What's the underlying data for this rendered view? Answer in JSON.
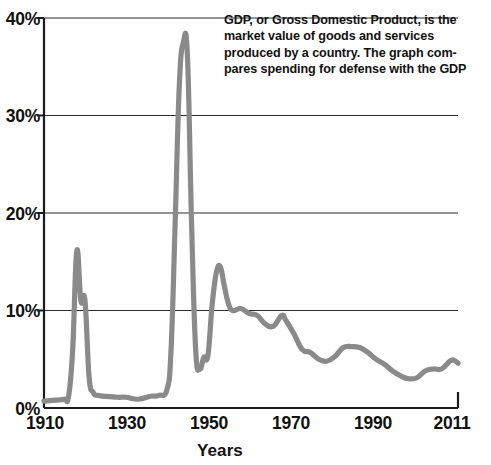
{
  "annotation": {
    "lines": [
      "GDP, or Gross Domestic Product, is the",
      "market value of goods and services",
      "produced by a country. The graph com-",
      "pares spending for defense with the GDP"
    ]
  },
  "axis": {
    "x_title": "Years",
    "y_ticks": [
      "0%",
      "10%",
      "20%",
      "30%",
      "40%"
    ],
    "x_ticks": [
      "1910",
      "1930",
      "1950",
      "1970",
      "1990",
      "2011"
    ]
  },
  "colors": {
    "line": "#8a8a8a",
    "axis": "#1a1a1a",
    "grid": "#2b2b2b",
    "text": "#111111",
    "background": "#ffffff"
  },
  "chart_data": {
    "type": "line",
    "title": "",
    "xlabel": "Years",
    "ylabel": "",
    "xlim": [
      1910,
      2011
    ],
    "ylim": [
      0,
      40
    ],
    "grid": true,
    "legend": false,
    "y_tick_values": [
      0,
      10,
      20,
      30,
      40
    ],
    "y_tick_labels": [
      "0%",
      "10%",
      "20%",
      "30%",
      "40%"
    ],
    "x_tick_values": [
      1910,
      1930,
      1950,
      1970,
      1990,
      2011
    ],
    "x_tick_labels": [
      "1910",
      "1930",
      "1950",
      "1970",
      "1990",
      "2011"
    ],
    "series": [
      {
        "name": "Defense spending as percent of GDP",
        "x": [
          1910,
          1913,
          1915,
          1916,
          1917,
          1918,
          1919,
          1920,
          1921,
          1922,
          1923,
          1925,
          1928,
          1930,
          1933,
          1936,
          1938,
          1940,
          1941,
          1942,
          1943,
          1944,
          1945,
          1946,
          1947,
          1948,
          1949,
          1950,
          1951,
          1952,
          1953,
          1954,
          1955,
          1956,
          1958,
          1960,
          1962,
          1964,
          1966,
          1968,
          1969,
          1971,
          1973,
          1975,
          1977,
          1979,
          1981,
          1983,
          1985,
          1987,
          1989,
          1991,
          1993,
          1995,
          1997,
          1999,
          2001,
          2003,
          2005,
          2007,
          2009,
          2010,
          2011
        ],
        "y": [
          0.7,
          0.8,
          0.9,
          1.2,
          6.0,
          16.1,
          11.0,
          11.0,
          3.2,
          1.6,
          1.3,
          1.2,
          1.1,
          1.1,
          0.9,
          1.2,
          1.3,
          1.9,
          6.0,
          19.0,
          33.0,
          37.5,
          36.0,
          19.0,
          6.0,
          4.0,
          5.2,
          5.4,
          10.5,
          13.8,
          14.5,
          12.5,
          10.7,
          10.0,
          10.2,
          9.7,
          9.5,
          8.6,
          8.4,
          9.5,
          9.0,
          7.6,
          6.0,
          5.7,
          5.0,
          4.8,
          5.3,
          6.2,
          6.3,
          6.2,
          5.7,
          5.0,
          4.5,
          3.8,
          3.3,
          3.0,
          3.1,
          3.8,
          4.0,
          4.0,
          4.8,
          4.9,
          4.6
        ],
        "color": "#8a8a8a",
        "peaks": [
          {
            "label": "World War I",
            "year": 1918,
            "value": 16.1
          },
          {
            "label": "World War II",
            "year": 1944,
            "value": 37.5
          },
          {
            "label": "Korean War",
            "year": 1953,
            "value": 14.5
          },
          {
            "label": "Vietnam War",
            "year": 1968,
            "value": 9.5
          },
          {
            "label": "Cold War buildup",
            "year": 1986,
            "value": 6.3
          }
        ]
      }
    ]
  }
}
